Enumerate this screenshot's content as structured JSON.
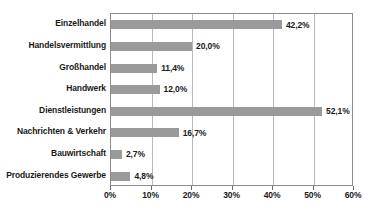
{
  "chart_data": {
    "type": "bar",
    "orientation": "horizontal",
    "title": "",
    "xlabel": "",
    "ylabel": "",
    "xlim": [
      0,
      60
    ],
    "xticks": [
      0,
      10,
      20,
      30,
      40,
      50,
      60
    ],
    "xtick_labels": [
      "0%",
      "10%",
      "20%",
      "30%",
      "40%",
      "50%",
      "60%"
    ],
    "grid": "vertical",
    "legend": "none",
    "bar_color": "#9a9a9a",
    "gridline_color": "#b9b9b9",
    "frame_color": "#8c8c8c",
    "categories": [
      "Einzelhandel",
      "Handelsvermittlung",
      "Großhandel",
      "Handwerk",
      "Dienstleistungen",
      "Nachrichten & Verkehr",
      "Bauwirtschaft",
      "Produzierendes Gewerbe"
    ],
    "values": [
      42.2,
      20.0,
      11.4,
      12.0,
      52.1,
      16.7,
      2.7,
      4.8
    ],
    "value_labels": [
      "42,2%",
      "20,0%",
      "11,4%",
      "12,0%",
      "52,1%",
      "16,7%",
      "2,7%",
      "4,8%"
    ]
  },
  "caption": {
    "text": ""
  }
}
